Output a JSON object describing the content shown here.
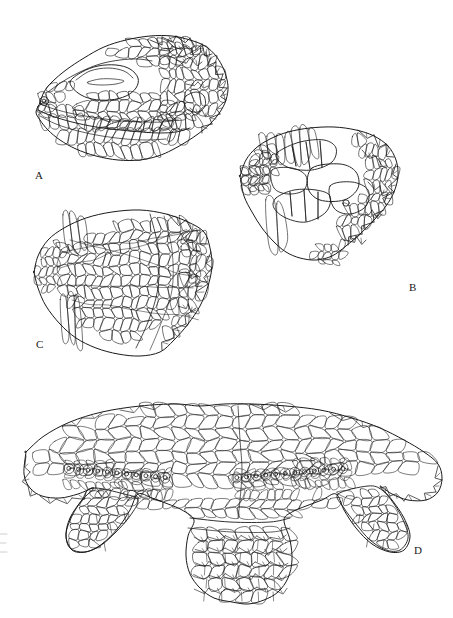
{
  "figure": {
    "type": "scientific-line-drawing-plate",
    "background_color": "#ffffff",
    "ink_color": "#1a1a1a",
    "width": 453,
    "height": 618,
    "panel_count": 4
  },
  "panels": [
    {
      "id": "A",
      "label": "A",
      "label_x": 35,
      "label_y": 170,
      "view": "lateral view of head",
      "features": [
        "nostril",
        "eye with eyelid",
        "labial scales",
        "temporal spines",
        "occipital spines",
        "gular scales"
      ],
      "bbox": [
        28,
        32,
        250,
        165
      ]
    },
    {
      "id": "B",
      "label": "B",
      "label_x": 409,
      "label_y": 282,
      "view": "dorsal view of head",
      "features": [
        "rostral shield",
        "supraocular shields",
        "interparietal shield",
        "parietal eye",
        "nuchal spines"
      ],
      "bbox": [
        232,
        122,
        415,
        290
      ]
    },
    {
      "id": "C",
      "label": "C",
      "label_x": 36,
      "label_y": 339,
      "view": "ventral view of head and throat",
      "features": [
        "mental shield",
        "chin shields",
        "gular scales",
        "gular fold"
      ],
      "bbox": [
        30,
        205,
        225,
        365
      ]
    },
    {
      "id": "D",
      "label": "D",
      "label_x": 414,
      "label_y": 545,
      "view": "ventral view of pelvic region and hind limbs",
      "features": [
        "ventral scales",
        "femoral pores",
        "preanal scales",
        "hind limb scales",
        "keeled tail scales"
      ],
      "bbox": [
        14,
        400,
        448,
        600
      ],
      "femoral_pore_rows": 2
    }
  ],
  "labels": {
    "a": "A",
    "b": "B",
    "c": "C",
    "d": "D"
  },
  "colors": {
    "ink": "#1a1a1a",
    "paper": "#ffffff",
    "artifact": "#cfcfcf"
  }
}
